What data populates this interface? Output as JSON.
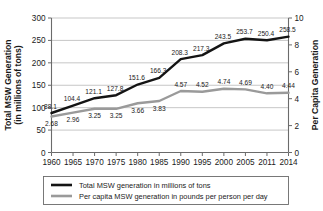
{
  "chart_data": {
    "type": "line",
    "title": "",
    "xlabel": "",
    "ylabel": "Total MSW Generation (in millions of tons)",
    "y2label": "Per Capita Generation",
    "categories": [
      "1960",
      "1965",
      "1970",
      "1975",
      "1980",
      "1985",
      "1990",
      "1995",
      "2000",
      "2005",
      "2011",
      "2014"
    ],
    "ylim": [
      0,
      300
    ],
    "y2lim": [
      0,
      10
    ],
    "yticks": [
      "0",
      "50",
      "100",
      "150",
      "200",
      "250",
      "300"
    ],
    "y2ticks": [
      "0",
      "2",
      "4",
      "6",
      "8",
      "10"
    ],
    "grid": true,
    "legend_position": "bottom",
    "series": [
      {
        "name": "Total MSW generation in millions of tons",
        "axis": "left",
        "color": "#141414",
        "values": [
          88.1,
          104.4,
          121.1,
          127.8,
          151.6,
          166.3,
          208.3,
          217.3,
          243.5,
          253.7,
          250.4,
          258.5
        ],
        "labels": [
          "88.1",
          "104.4",
          "121.1",
          "127.8",
          "151.6",
          "166.3",
          "208.3",
          "217.3",
          "243.5",
          "253.7",
          "250.4",
          "258.5"
        ]
      },
      {
        "name": "Per capita MSW generation in pounds per person per day",
        "axis": "right",
        "color": "#9a9a9a",
        "values": [
          2.68,
          2.96,
          3.25,
          3.25,
          3.66,
          3.83,
          4.57,
          4.52,
          4.74,
          4.69,
          4.4,
          4.44
        ],
        "labels": [
          "2.68",
          "2.96",
          "3.25",
          "3.25",
          "3.66",
          "3.83",
          "4.57",
          "4.52",
          "4.74",
          "4.69",
          "4.40",
          "4.44"
        ]
      }
    ]
  },
  "axes": {
    "left_title_line1": "Total MSW Generation",
    "left_title_line2": "(in millions of tons)",
    "right_title": "Per Capita Generation"
  },
  "legend": {
    "items": [
      {
        "label": "Total MSW generation in millions of tons",
        "color": "#141414"
      },
      {
        "label": "Per capita MSW generation in pounds per person per day",
        "color": "#9a9a9a"
      }
    ]
  }
}
